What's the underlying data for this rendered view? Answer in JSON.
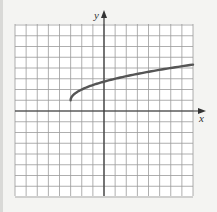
{
  "chart_data": {
    "type": "line",
    "title": "",
    "xlabel": "x",
    "ylabel": "y",
    "xlim": [
      -8,
      8
    ],
    "ylim": [
      -8,
      8
    ],
    "grid": true,
    "grid_step": 1,
    "legend": null,
    "function": "y = sqrt(x + 3) + 1",
    "series": [
      {
        "name": "curve",
        "color": "#555555",
        "x": [
          -3,
          -2.75,
          -2.5,
          -2,
          -1,
          0,
          1,
          2,
          3,
          4,
          5,
          6,
          7,
          8
        ],
        "y": [
          1,
          1.5,
          1.71,
          2,
          2.41,
          2.73,
          3,
          3.24,
          3.45,
          3.65,
          3.83,
          4,
          4.16,
          4.32
        ]
      }
    ],
    "annotations": [
      {
        "type": "start-point",
        "x": -3,
        "y": 1
      }
    ]
  },
  "axes": {
    "x_label": "x",
    "y_label": "y"
  },
  "colors": {
    "background": "#f4f4f2",
    "plot_background": "#ffffff",
    "grid": "#9a9a9a",
    "axis": "#333333",
    "curve": "#555555"
  }
}
